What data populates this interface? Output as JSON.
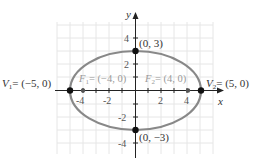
{
  "diagram": {
    "axes": {
      "x_label": "x",
      "y_label": "y"
    },
    "x_ticks": [
      "-4",
      "-2",
      "2",
      "4"
    ],
    "y_ticks": [
      "4",
      "2",
      "-2",
      "-4"
    ],
    "ellipse": {
      "a": 5,
      "b": 3,
      "color": "#808080"
    },
    "points": {
      "v1": {
        "label_name": "V",
        "sub": "1",
        "label_value": "= (−5, 0)"
      },
      "v2": {
        "label_name": "V",
        "sub": "2",
        "label_value": "= (5, 0)"
      },
      "top": {
        "label": "(0, 3)"
      },
      "bottom": {
        "label": "(0, −3)"
      },
      "f1": {
        "label_name": "F",
        "sub": "1",
        "label_value": "= (−4, 0)"
      },
      "f2": {
        "label_name": "F",
        "sub": "2",
        "label_value": "= (4, 0)"
      }
    }
  }
}
